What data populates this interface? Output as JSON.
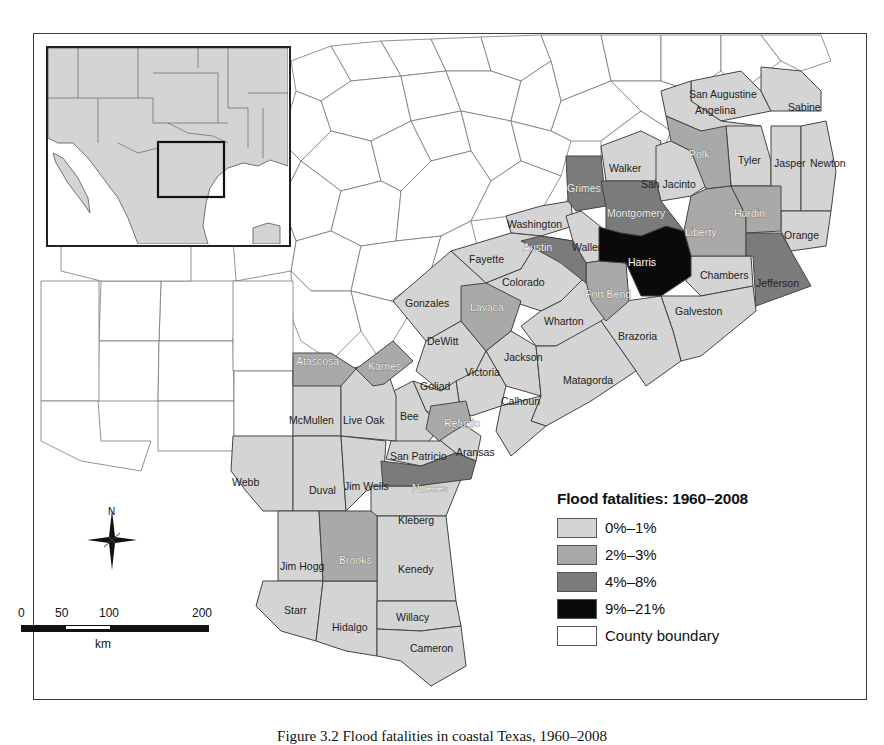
{
  "map": {
    "title": "Flood fatalities in coastal Texas counties",
    "legend": {
      "title": "Flood fatalities: 1960–2008",
      "classes": [
        {
          "label": "0%–1%",
          "color": "#d4d4d4"
        },
        {
          "label": "2%–3%",
          "color": "#a9a9a9"
        },
        {
          "label": "4%–8%",
          "color": "#7b7b7b"
        },
        {
          "label": "9%–21%",
          "color": "#0a0a0a"
        },
        {
          "label": "County boundary",
          "color": "#ffffff"
        }
      ]
    },
    "north_arrow": {
      "label": "N"
    },
    "scale_bar": {
      "ticks": [
        "0",
        "50",
        "100",
        "200"
      ],
      "unit": "km"
    },
    "counties": {
      "class_0_1": [
        "San Augustine",
        "Sabine",
        "Angelina",
        "Walker",
        "San Jacinto",
        "Tyler",
        "Jasper",
        "Newton",
        "Orange",
        "Washington",
        "Waller",
        "Fayette",
        "Colorado",
        "Chambers",
        "Galveston",
        "Brazoria",
        "Wharton",
        "Gonzales",
        "DeWitt",
        "Jackson",
        "Victoria",
        "Matagorda",
        "Goliad",
        "Calhoun",
        "Bee",
        "McMullen",
        "Live Oak",
        "San Patricio",
        "Aransas",
        "Webb",
        "Duval",
        "Jim Wells",
        "Kleberg",
        "Jim Hogg",
        "Kenedy",
        "Starr",
        "Hidalgo",
        "Willacy",
        "Cameron"
      ],
      "class_2_3": [
        "Polk",
        "Liberty",
        "Hardin",
        "Fort Bend",
        "Lavaca",
        "Atascosa",
        "Karnes",
        "Refugio",
        "Brooks"
      ],
      "class_4_8": [
        "Grimes",
        "Montgomery",
        "Austin",
        "Jefferson",
        "Nueces"
      ],
      "class_9_21": [
        "Harris"
      ]
    },
    "labels": {
      "san_augustine": "San Augustine",
      "sabine": "Sabine",
      "angelina": "Angelina",
      "walker": "Walker",
      "polk": "Polk",
      "tyler": "Tyler",
      "jasper": "Jasper",
      "newton": "Newton",
      "grimes": "Grimes",
      "san_jacinto": "San Jacinto",
      "montgomery": "Montgomery",
      "hardin": "Hardin",
      "liberty": "Liberty",
      "orange": "Orange",
      "washington": "Washington",
      "austin": "Austin",
      "waller": "Waller",
      "harris": "Harris",
      "chambers": "Chambers",
      "jefferson": "Jefferson",
      "fayette": "Fayette",
      "colorado": "Colorado",
      "fort_bend": "Fort Bend",
      "galveston": "Galveston",
      "gonzales": "Gonzales",
      "lavaca": "Lavaca",
      "wharton": "Wharton",
      "brazoria": "Brazoria",
      "dewitt": "DeWitt",
      "jackson": "Jackson",
      "atascosa": "Atascosa",
      "karnes": "Karnes",
      "victoria": "Victoria",
      "matagorda": "Matagorda",
      "goliad": "Goliad",
      "mcmullen": "McMullen",
      "live_oak": "Live Oak",
      "bee": "Bee",
      "calhoun": "Calhoun",
      "refugio": "Refugio",
      "san_patricio": "San Patricio",
      "aransas": "Aransas",
      "webb": "Webb",
      "duval": "Duval",
      "jim_wells": "Jim Wells",
      "nueces": "Nueces",
      "kleberg": "Kleberg",
      "jim_hogg": "Jim Hogg",
      "brooks": "Brooks",
      "kenedy": "Kenedy",
      "starr": "Starr",
      "willacy": "Willacy",
      "hidalgo": "Hidalgo",
      "cameron": "Cameron"
    }
  },
  "caption": "Figure 3.2 Flood fatalities in coastal Texas, 1960–2008"
}
